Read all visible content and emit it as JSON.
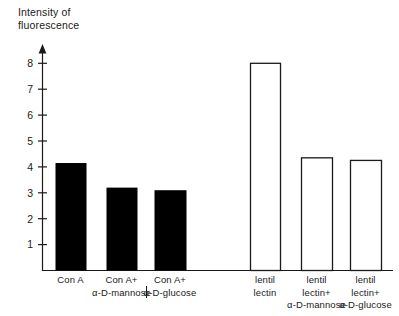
{
  "figure": {
    "y_axis_title": "Intensity of\nfluorescence",
    "axis_color": "#1a1a1a",
    "bar_fill_filled": "#000000",
    "bar_fill_open": "#ffffff"
  },
  "chart_data": {
    "type": "bar",
    "title": "",
    "xlabel": "",
    "ylabel": "Intensity of fluorescence",
    "ylim": [
      0,
      8.8
    ],
    "yticks": [
      1,
      2,
      3,
      4,
      5,
      6,
      7,
      8
    ],
    "ytick_labels": [
      "1",
      "2",
      "3",
      "4",
      "5",
      "6",
      "7",
      "8"
    ],
    "grid": false,
    "legend": "none",
    "categories": [
      "Con A",
      "Con A+\nα-D-mannose",
      "Con A+\nα-D-glucose",
      "lentil\nlectin",
      "lentil\nlectin+\nα-D-mannose",
      "lentil\nlectin+\nα-D-glucose"
    ],
    "values": [
      4.15,
      3.2,
      3.1,
      8.0,
      4.35,
      4.25
    ],
    "bar_styles": [
      "filled",
      "filled",
      "filled",
      "open",
      "open",
      "open"
    ],
    "groups": [
      {
        "name": "Con A",
        "category_indices": [
          0,
          1,
          2
        ]
      },
      {
        "name": "lentil lectin",
        "category_indices": [
          3,
          4,
          5
        ]
      }
    ]
  },
  "bars": [
    {
      "label": "Con A",
      "value": 4.15,
      "style": "filled",
      "x": 55,
      "width": 31
    },
    {
      "label": "Con A+ α-D-mannose",
      "value": 3.2,
      "style": "filled",
      "x": 106,
      "width": 31
    },
    {
      "label": "Con A+ α-D-glucose",
      "value": 3.1,
      "style": "filled",
      "x": 154,
      "width": 32
    },
    {
      "label": "lentil lectin",
      "value": 8.0,
      "style": "open",
      "x": 250,
      "width": 30
    },
    {
      "label": "lentil lectin+ α-D-mannose",
      "value": 4.35,
      "style": "open",
      "x": 301,
      "width": 31
    },
    {
      "label": "lentil lectin+ α-D-glucose",
      "value": 4.25,
      "style": "open",
      "x": 350,
      "width": 31
    }
  ],
  "category_labels": [
    {
      "line1": "Con A",
      "line2": "",
      "line3": ""
    },
    {
      "line1": "Con A+",
      "line2": "α-D-mannose",
      "line3": ""
    },
    {
      "line1": "Con A+",
      "line2": "α-D-glucose",
      "line3": ""
    },
    {
      "line1": "lentil",
      "line2": "lectin",
      "line3": ""
    },
    {
      "line1": "lentil",
      "line2": "lectin+",
      "line3": "α-D-mannose"
    },
    {
      "line1": "lentil",
      "line2": "lectin+",
      "line3": "α-D-glucose"
    }
  ]
}
